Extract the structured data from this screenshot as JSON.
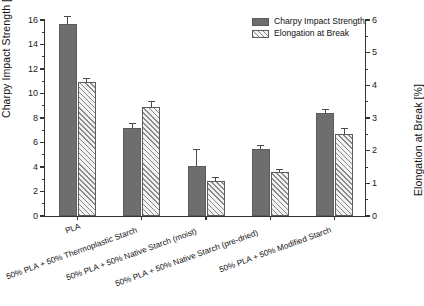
{
  "chart_data": {
    "type": "bar",
    "title": "",
    "categories": [
      "PLA",
      "50% PLA + 50% Thermoplastic Starch",
      "50% PLA + 50% Native Starch (moist)",
      "50% PLA + 50% Native Starch (pre-dried)",
      "50% PLA + 50% Modified Starch"
    ],
    "series": [
      {
        "name": "Charpy Impact Strength",
        "axis": "left",
        "unit": "kJ/m^2",
        "values": [
          15.7,
          7.2,
          4.1,
          5.5,
          8.4
        ],
        "errors": [
          0.55,
          0.3,
          1.25,
          0.25,
          0.25
        ],
        "color": "#6e6e6e",
        "fill": "solid"
      },
      {
        "name": "Elongation at Break",
        "axis": "right",
        "unit": "%",
        "values": [
          4.1,
          3.35,
          1.08,
          1.35,
          2.5
        ],
        "errors": [
          0.08,
          0.13,
          0.07,
          0.07,
          0.17
        ],
        "color": "#8a8a8a",
        "fill": "diagonal-hatch"
      }
    ],
    "xlabel": "",
    "ylabel": "Charpy Impact Strength [kJ/m2]",
    "y2label": "Elongation at Break [%]",
    "ylim": [
      0,
      16
    ],
    "y2lim": [
      0,
      6
    ],
    "yticks": [
      0,
      2,
      4,
      6,
      8,
      10,
      12,
      14,
      16
    ],
    "y2ticks": [
      0,
      1,
      2,
      3,
      4,
      5,
      6
    ],
    "grid": false,
    "legend_position": "top-right"
  },
  "axes": {
    "left_title_main": "Charpy Impact Strength [kJ/m",
    "left_title_sup": "2",
    "left_title_tail": "]",
    "right_title": "Elongation at Break [%]",
    "left_ticks": [
      "0",
      "2",
      "4",
      "6",
      "8",
      "10",
      "12",
      "14",
      "16"
    ],
    "right_ticks": [
      "0",
      "1",
      "2",
      "3",
      "4",
      "5",
      "6"
    ]
  },
  "legend": {
    "items": [
      {
        "label": "Charpy Impact Strength"
      },
      {
        "label": "Elongation at Break"
      }
    ]
  },
  "categories": [
    {
      "label": "PLA"
    },
    {
      "label": "50% PLA + 50% Thermoplastic Starch"
    },
    {
      "label": "50% PLA + 50% Native Starch (moist)"
    },
    {
      "label": "50% PLA + 50% Native Starch (pre-dried)"
    },
    {
      "label": "50% PLA + 50% Modified Starch"
    }
  ]
}
